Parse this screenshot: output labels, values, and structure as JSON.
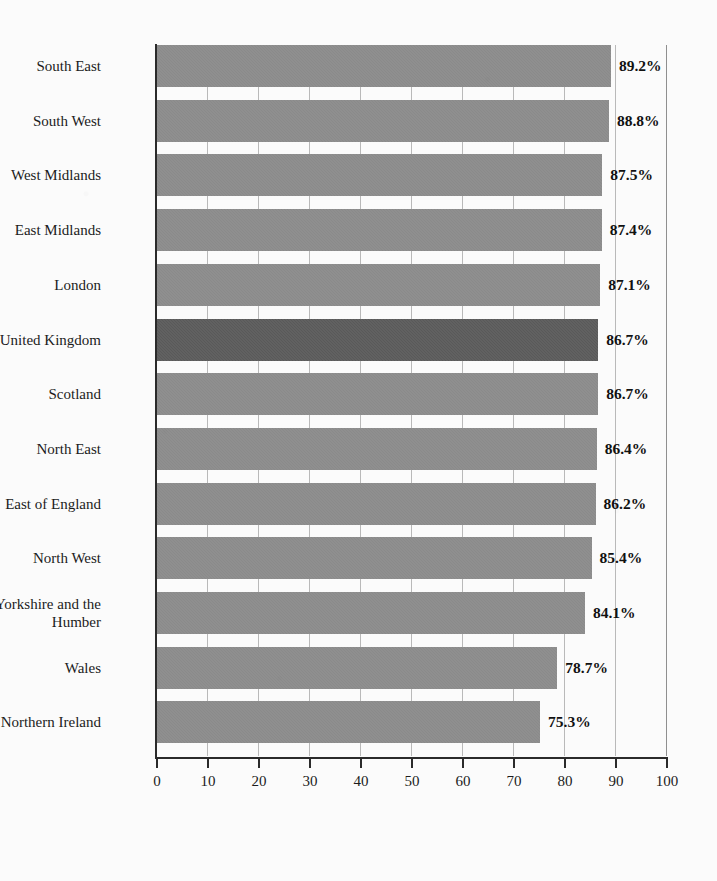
{
  "chart_data": {
    "type": "bar",
    "orientation": "horizontal",
    "title": "",
    "subtitle": "",
    "xlabel": "",
    "ylabel": "",
    "xlim": [
      0,
      100
    ],
    "xticks": [
      "0",
      "10",
      "20",
      "30",
      "40",
      "50",
      "60",
      "70",
      "80",
      "90",
      "100"
    ],
    "xtick_values": [
      0,
      10,
      20,
      30,
      40,
      50,
      60,
      70,
      80,
      90,
      100
    ],
    "grid": "vertical",
    "legend": "none",
    "value_label_suffix": "%",
    "categories": [
      "South East",
      "South West",
      "West Midlands",
      "East Midlands",
      "London",
      "United Kingdom",
      "Scotland",
      "North East",
      "East of England",
      "North West",
      "Yorkshire and the\nHumber",
      "Wales",
      "Northern Ireland"
    ],
    "values": [
      89.2,
      88.8,
      87.5,
      87.4,
      87.1,
      86.7,
      86.7,
      86.4,
      86.2,
      85.4,
      84.1,
      78.7,
      75.3
    ],
    "value_labels": [
      "89.2%",
      "88.8%",
      "87.5%",
      "87.4%",
      "87.1%",
      "86.7%",
      "86.7%",
      "86.4%",
      "86.2%",
      "85.4%",
      "84.1%",
      "78.7%",
      "75.3%"
    ],
    "highlighted_category": "United Kingdom",
    "colors": {
      "bar": "#8d8d8d",
      "bar_highlight": "#5b5b5b",
      "axis": "#2b2b2b",
      "gridline": "#b9b9b9",
      "text": "#1c1c1c",
      "background": "#fbfbfb"
    }
  }
}
